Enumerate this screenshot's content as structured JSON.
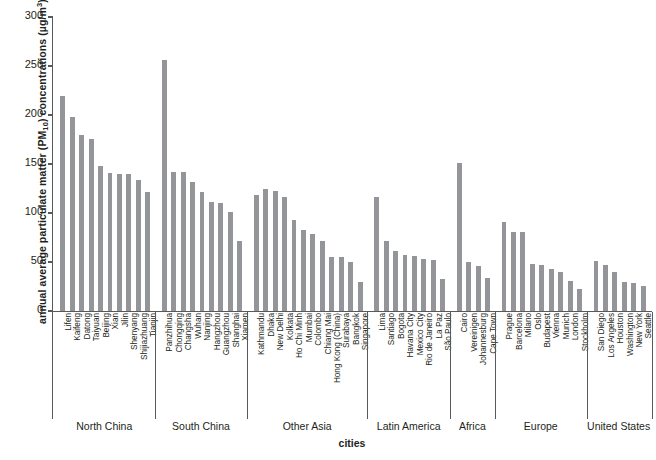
{
  "chart_data": {
    "type": "bar",
    "title": "",
    "xlabel": "cities",
    "ylabel_plain": "annual average particulate matter (PM10) concentrations (µg/m3)",
    "ylabel_parts": {
      "pre": "annual average particulate matter (PM",
      "sub": "10",
      "mid": ") concentrations (µg/m",
      "sup": "3",
      "post": ")"
    },
    "ylim": [
      0,
      300
    ],
    "yticks": [
      0,
      50,
      100,
      150,
      200,
      250,
      300
    ],
    "ytick_labels": [
      "0",
      "50",
      "100",
      "150",
      "200",
      "250",
      "300"
    ],
    "grid": false,
    "legend": "none",
    "bar_color": "#939598",
    "axis_color": "#58595b",
    "categories": [
      "Lifen",
      "Kaifeng",
      "Datong",
      "Taiyuan",
      "Beijing",
      "Xian",
      "Jilin",
      "Shenyang",
      "Shijiazhuang",
      "Tianjin",
      "Panzhihua",
      "Chongqing",
      "Changsha",
      "Wuhan",
      "Nanjing",
      "Hangzhou",
      "Guangzhou",
      "Shanghai",
      "Xiamen",
      "Kathmandu",
      "Dhaka",
      "New Delhi",
      "Kolkata",
      "Ho Chi Minh",
      "Mumbai",
      "Colombo",
      "Chiang Mai",
      "Hong Kong (China)",
      "Surabaya",
      "Bangkok",
      "Singapore",
      "Lima",
      "Santiago",
      "Bogota",
      "Havana City",
      "Mexico City",
      "Rio de Janeiro",
      "La Paz",
      "São Paulo",
      "Cairo",
      "Vereinigen",
      "Johannesburg",
      "Cape Town",
      "Prague",
      "Barcelona",
      "Milano",
      "Oslo",
      "Budapest",
      "Vienna",
      "Munich",
      "London",
      "Stockholm",
      "San Diego",
      "Los Angeles",
      "Houston",
      "Washington",
      "New York",
      "Seattle"
    ],
    "values": [
      219,
      198,
      180,
      176,
      148,
      141,
      140,
      140,
      134,
      121,
      256,
      142,
      142,
      132,
      121,
      111,
      110,
      101,
      71,
      118,
      124,
      122,
      116,
      93,
      83,
      79,
      71,
      55,
      55,
      50,
      30,
      116,
      71,
      61,
      57,
      56,
      53,
      52,
      33,
      151,
      50,
      46,
      34,
      91,
      81,
      81,
      48,
      47,
      43,
      40,
      31,
      22,
      51,
      47,
      40,
      30,
      29,
      26
    ],
    "groups": [
      {
        "label": "North China",
        "start": 0,
        "end": 9
      },
      {
        "label": "South China",
        "start": 10,
        "end": 18
      },
      {
        "label": "Other Asia",
        "start": 19,
        "end": 30
      },
      {
        "label": "Latin America",
        "start": 31,
        "end": 38
      },
      {
        "label": "Africa",
        "start": 39,
        "end": 42
      },
      {
        "label": "Europe",
        "start": 43,
        "end": 51
      },
      {
        "label": "United States",
        "start": 52,
        "end": 57
      }
    ]
  }
}
